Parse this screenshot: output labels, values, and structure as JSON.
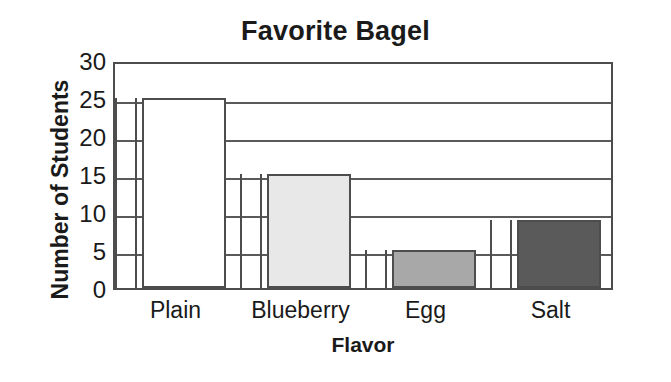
{
  "chart_data": {
    "type": "bar",
    "title": "Favorite Bagel",
    "xlabel": "Flavor",
    "ylabel": "Number of Students",
    "categories": [
      "Plain",
      "Blueberry",
      "Egg",
      "Salt"
    ],
    "values": [
      25,
      15,
      5,
      9
    ],
    "ylim": [
      0,
      30
    ],
    "yticks": [
      0,
      5,
      10,
      15,
      20,
      25,
      30
    ],
    "ytick_labels": [
      "0",
      "5",
      "10",
      "15",
      "20",
      "25",
      "30"
    ],
    "grid": true,
    "legend": "none",
    "bar_colors": [
      "#ffffff",
      "#e8e8e8",
      "#a8a8a8",
      "#5a5a5a"
    ],
    "bar_edge_color": "#4d4d4d",
    "gridline_color": "#5a5a5a",
    "background": "#ffffff",
    "text_color": "#1a1a1a"
  }
}
